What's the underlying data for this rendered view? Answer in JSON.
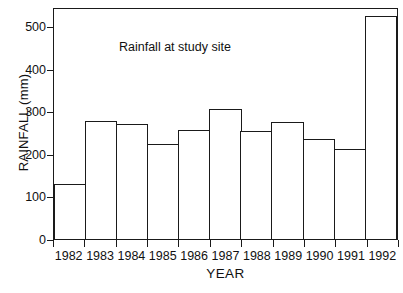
{
  "chart_data": {
    "type": "bar",
    "title": "Rainfall at study site",
    "xlabel": "YEAR",
    "ylabel": "RAINFALL (mm)",
    "categories": [
      "1982",
      "1983",
      "1984",
      "1985",
      "1986",
      "1987",
      "1988",
      "1989",
      "1990",
      "1991",
      "1992"
    ],
    "values": [
      130,
      278,
      271,
      224,
      257,
      306,
      253,
      275,
      234,
      212,
      523
    ],
    "ylim": [
      0,
      545
    ],
    "yticks": [
      0,
      100,
      200,
      300,
      400,
      500
    ],
    "ytick_labels": [
      "0",
      "100",
      "200",
      "300",
      "400",
      "500"
    ],
    "grid": false,
    "legend": null,
    "series": [
      {
        "name": "Rainfall",
        "values": [
          130,
          278,
          271,
          224,
          257,
          306,
          253,
          275,
          234,
          212,
          523
        ]
      }
    ],
    "annotations": [
      {
        "text": "Rainfall at study site",
        "x": "1984",
        "y": 455
      }
    ],
    "style": {
      "bar_fill": "#ffffff",
      "bar_edge": "#1a1a1a",
      "frame_color": "#1a1a1a",
      "background": "#ffffff",
      "text_color": "#111111"
    }
  },
  "figure": {
    "annotation_text": "Rainfall at study site"
  }
}
